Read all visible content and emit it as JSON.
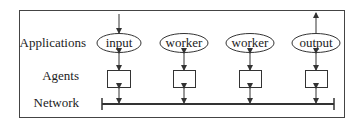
{
  "diagram": {
    "row_labels": {
      "applications": "Applications",
      "agents": "Agents",
      "network": "Network"
    },
    "applications": [
      {
        "label": "input",
        "cx": 119,
        "external_arrow": "in"
      },
      {
        "label": "worker",
        "cx": 184,
        "external_arrow": "none"
      },
      {
        "label": "worker",
        "cx": 250,
        "external_arrow": "none"
      },
      {
        "label": "output",
        "cx": 316,
        "external_arrow": "out"
      }
    ],
    "colors": {
      "stroke": "#333333",
      "text": "#222222",
      "background": "#ffffff"
    }
  }
}
